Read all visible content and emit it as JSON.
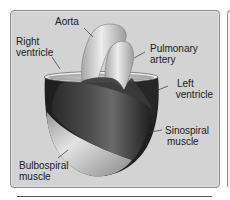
{
  "diagram": {
    "type": "anatomical-illustration",
    "labels": {
      "aorta": [
        "Aorta"
      ],
      "right_ventricle": [
        "Right",
        "ventricle"
      ],
      "pulmonary_artery": [
        "Pulmonary",
        "artery"
      ],
      "left_ventricle": [
        "Left",
        "ventricle"
      ],
      "sinospiral_muscle": [
        "Sinospiral",
        "muscle"
      ],
      "bulbospiral_muscle": [
        "Bulbospiral",
        "muscle"
      ]
    },
    "colors": {
      "panel_background": "#d3d3d3",
      "panel_border": "#8a8a8a",
      "sinospiral_dark": "#3a3a3a",
      "bulbospiral_light": "#c9c9c9",
      "vessels": "#dedede",
      "label_text": "#1a1a1a"
    }
  }
}
